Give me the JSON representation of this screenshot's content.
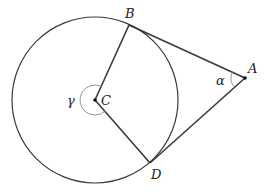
{
  "diagram": {
    "type": "geometry",
    "colors": {
      "stroke": "#3a3a3a",
      "arc": "#8a8a8a",
      "background": "#ffffff"
    },
    "points": {
      "A": {
        "label": "A"
      },
      "B": {
        "label": "B"
      },
      "C": {
        "label": "C"
      },
      "D": {
        "label": "D"
      }
    },
    "angles": {
      "alpha": {
        "label": "α",
        "at": "A"
      },
      "gamma": {
        "label": "γ",
        "at": "C"
      }
    }
  }
}
